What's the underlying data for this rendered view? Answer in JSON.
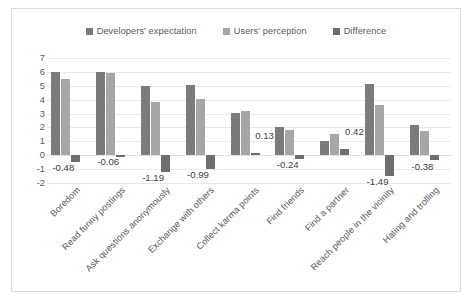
{
  "chart_data": {
    "type": "bar",
    "title": "",
    "xlabel": "",
    "ylabel": "",
    "ylim": [
      -2,
      7
    ],
    "yticks": [
      "7",
      "6",
      "5",
      "4",
      "3",
      "2",
      "1",
      "0",
      "-1",
      "-2"
    ],
    "grid": true,
    "legend_position": "top-center",
    "categories": [
      "Boredom",
      "Read funny postings",
      "Ask questions anonymously",
      "Exchange with others",
      "Collect karma points",
      "Find friends",
      "Find a partner",
      "Reach people in the vicinity",
      "Hating and trolling"
    ],
    "series": [
      {
        "name": "Developers' expectation",
        "color": "#7b7b7b",
        "values": [
          6.0,
          6.0,
          5.0,
          5.05,
          3.05,
          2.05,
          1.05,
          5.1,
          2.15
        ]
      },
      {
        "name": "Users' perception",
        "color": "#a6a6a6",
        "values": [
          5.5,
          5.95,
          3.85,
          4.05,
          3.15,
          1.82,
          1.5,
          3.6,
          1.72
        ]
      },
      {
        "name": "Difference",
        "color": "#6e6e6e",
        "values": [
          -0.48,
          -0.06,
          -1.19,
          -0.99,
          0.13,
          -0.24,
          0.42,
          -1.49,
          -0.38
        ]
      }
    ],
    "data_labels": [
      "-0.48",
      "-0.06",
      "-1.19",
      "-0.99",
      "0.13",
      "-0.24",
      "0.42",
      "-1.49",
      "-0.38"
    ]
  },
  "colors": {
    "series1": "#7b7b7b",
    "series2": "#a6a6a6",
    "series3": "#6e6e6e",
    "grid": "#e8e8e8",
    "text": "#595959",
    "border": "#d9d9d9",
    "background": "#ffffff"
  }
}
